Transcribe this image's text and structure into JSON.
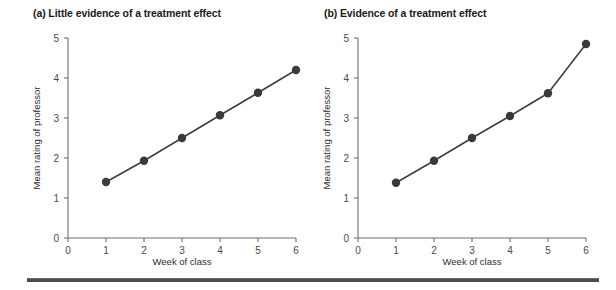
{
  "figure": {
    "background_color": "#ffffff",
    "line_color": "#3f3f43",
    "marker_color": "#3a3a3e",
    "axis_color": "#6f6f6f",
    "footer_rule_color": "#4c4c4c"
  },
  "panels": [
    {
      "id": "a",
      "title": "(a) Little evidence of a treatment effect"
    },
    {
      "id": "b",
      "title": "(b) Evidence of a treatment effect"
    }
  ],
  "chart_data": [
    {
      "type": "line",
      "title": "(a) Little evidence of a treatment effect",
      "xlabel": "Week of class",
      "ylabel": "Mean rating of professor",
      "x": [
        1,
        2,
        3,
        4,
        5,
        6
      ],
      "values": [
        1.4,
        1.93,
        2.5,
        3.07,
        3.63,
        4.2
      ],
      "xlim": [
        0,
        6
      ],
      "ylim": [
        0,
        5
      ],
      "xticks": [
        0,
        1,
        2,
        3,
        4,
        5,
        6
      ],
      "xticklabels": [
        "0",
        "1",
        "2",
        "3",
        "4",
        "5",
        "6"
      ],
      "yticks": [
        0,
        1,
        2,
        3,
        4,
        5
      ],
      "yticklabels": [
        "0",
        "1",
        "2",
        "3",
        "4",
        "5"
      ],
      "grid": false,
      "legend": "none",
      "markers": "filled-circle"
    },
    {
      "type": "line",
      "title": "(b) Evidence of a treatment effect",
      "xlabel": "Week of class",
      "ylabel": "Mean rating of professor",
      "x": [
        1,
        2,
        3,
        4,
        5,
        6
      ],
      "values": [
        1.38,
        1.93,
        2.5,
        3.05,
        3.62,
        4.85
      ],
      "xlim": [
        0,
        6
      ],
      "ylim": [
        0,
        5
      ],
      "xticks": [
        0,
        1,
        2,
        3,
        4,
        5,
        6
      ],
      "xticklabels": [
        "0",
        "1",
        "2",
        "3",
        "4",
        "5",
        "6"
      ],
      "yticks": [
        0,
        1,
        2,
        3,
        4,
        5
      ],
      "yticklabels": [
        "0",
        "1",
        "2",
        "3",
        "4",
        "5"
      ],
      "grid": false,
      "legend": "none",
      "markers": "filled-circle"
    }
  ]
}
